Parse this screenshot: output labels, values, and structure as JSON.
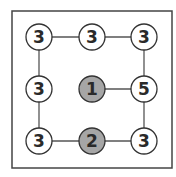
{
  "diagram": {
    "frame": {
      "x": 12,
      "y": 11,
      "w": 160,
      "h": 157,
      "stroke": "#444444"
    },
    "node_radius": 13,
    "colors": {
      "empty_fill": "#ffffff",
      "filled_fill": "#a6a6a6",
      "stroke": "#333333",
      "edge": "#555555"
    },
    "nodes": [
      {
        "id": "n00",
        "row": 0,
        "col": 0,
        "x": 39,
        "y": 37,
        "label": "3",
        "filled": false
      },
      {
        "id": "n01",
        "row": 0,
        "col": 1,
        "x": 92,
        "y": 37,
        "label": "3",
        "filled": false
      },
      {
        "id": "n02",
        "row": 0,
        "col": 2,
        "x": 144,
        "y": 37,
        "label": "3",
        "filled": false
      },
      {
        "id": "n10",
        "row": 1,
        "col": 0,
        "x": 39,
        "y": 89,
        "label": "3",
        "filled": false
      },
      {
        "id": "n11",
        "row": 1,
        "col": 1,
        "x": 92,
        "y": 89,
        "label": "1",
        "filled": true
      },
      {
        "id": "n12",
        "row": 1,
        "col": 2,
        "x": 144,
        "y": 89,
        "label": "5",
        "filled": false
      },
      {
        "id": "n20",
        "row": 2,
        "col": 0,
        "x": 39,
        "y": 141,
        "label": "3",
        "filled": false
      },
      {
        "id": "n21",
        "row": 2,
        "col": 1,
        "x": 92,
        "y": 141,
        "label": "2",
        "filled": true
      },
      {
        "id": "n22",
        "row": 2,
        "col": 2,
        "x": 144,
        "y": 141,
        "label": "3",
        "filled": false
      }
    ],
    "edges": [
      [
        "n00",
        "n01"
      ],
      [
        "n01",
        "n02"
      ],
      [
        "n00",
        "n10"
      ],
      [
        "n10",
        "n20"
      ],
      [
        "n02",
        "n12"
      ],
      [
        "n12",
        "n22"
      ],
      [
        "n11",
        "n12"
      ],
      [
        "n20",
        "n21"
      ],
      [
        "n21",
        "n22"
      ]
    ]
  }
}
